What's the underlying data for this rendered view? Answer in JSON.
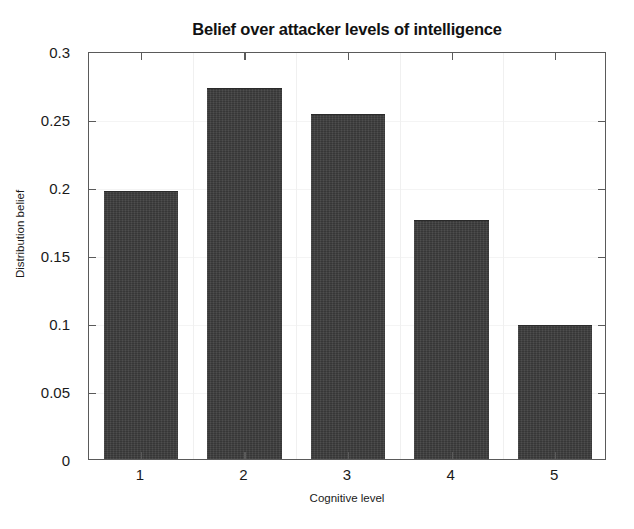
{
  "chart_data": {
    "type": "bar",
    "title": "Belief over attacker levels of intelligence",
    "xlabel": "Cognitive level",
    "ylabel": "Distribution belief",
    "categories": [
      "1",
      "2",
      "3",
      "4",
      "5"
    ],
    "values": [
      0.196,
      0.272,
      0.253,
      0.175,
      0.098
    ],
    "ylim": [
      0,
      0.3
    ],
    "yticks": [
      "0",
      "0.05",
      "0.1",
      "0.15",
      "0.2",
      "0.25",
      "0.3"
    ],
    "ytick_values": [
      0,
      0.05,
      0.1,
      0.15,
      0.2,
      0.25,
      0.3
    ],
    "grid": false,
    "legend": null,
    "bar_color": "#3c3c3c",
    "axis_color": "#5a5a5a",
    "background_color": "#ffffff"
  }
}
